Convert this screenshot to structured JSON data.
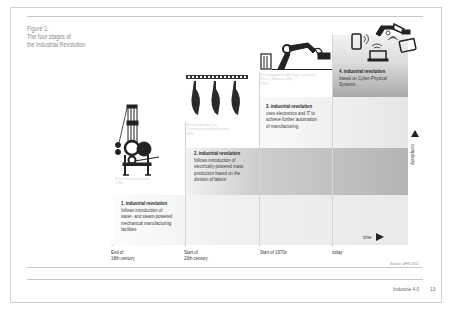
{
  "figure": {
    "label": "Figure 1:",
    "title_line1": "The four stages of",
    "title_line2": "the Industrial Revolution"
  },
  "stages": [
    {
      "number": "1.",
      "title": "industrial revolution",
      "lines": [
        "follows introduction of",
        "water- and steam-powered",
        "mechanical manufacturing",
        "facilities"
      ],
      "icon": "mechanical-loom-icon",
      "caption_line1": "First mechanical loom,",
      "caption_line2": "1784",
      "period": [
        "End of",
        "18th century"
      ]
    },
    {
      "number": "2.",
      "title": "industrial revolution",
      "lines": [
        "follows introduction of",
        "electrically-powered mass",
        "production based on the",
        "division of labour"
      ],
      "icon": "assembly-line-icon",
      "caption_line1": "First production line,",
      "caption_line2": "Cincinnati slaughterhouses,",
      "caption_line3": "1870",
      "period": [
        "Start of",
        "20th century"
      ]
    },
    {
      "number": "3.",
      "title": "industrial revolution",
      "lines": [
        "uses electronics and IT to",
        "achieve further automation",
        "of manufacturing"
      ],
      "icon": "robot-arm-icon",
      "caption_line1": "First programmable logic controller",
      "caption_line2": "(PLC), Modicon 084,",
      "caption_line3": "1969",
      "period": [
        "Start of 1970s"
      ]
    },
    {
      "number": "4.",
      "title": "industrial revolution",
      "lines": [
        "based on Cyber-Physical",
        "Systems"
      ],
      "icon": "cyber-physical-systems-icon",
      "period": [
        "today"
      ]
    }
  ],
  "axes": {
    "x_label": "time",
    "y_label": "complexity"
  },
  "source": "Source: DFKI 2011",
  "footer": {
    "publication": "Industrie 4.0",
    "page_number": "13"
  },
  "colors": {
    "band_dark": "#9a9a9a",
    "band_mid": "#b8b8b8",
    "band_light": "#ececec",
    "text": "#333333"
  }
}
